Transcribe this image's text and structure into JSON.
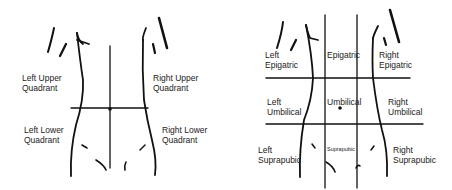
{
  "quadrant_diagram": {
    "labels": {
      "luq": "Left Upper\nQuadrant",
      "ruq": "Right Upper\nQuadrant",
      "llq": "Left Lower\nQuadrant",
      "rlq": "Right Lower\nQuadrant"
    }
  },
  "region_diagram": {
    "labels": {
      "left_epigastric": "Left\nEpigatric",
      "epigastric": "Epigatric",
      "right_epigastric": "Right\nEpigatric",
      "left_umbilical": "Left\nUmbilical",
      "umbilical": "Umbilical",
      "right_umbilical": "Right\nUmbilical",
      "left_suprapubic": "Left\nSuprapubic",
      "suprapubic": "Suprapubic",
      "right_suprapubic": "Right\nSuprapubic"
    }
  }
}
